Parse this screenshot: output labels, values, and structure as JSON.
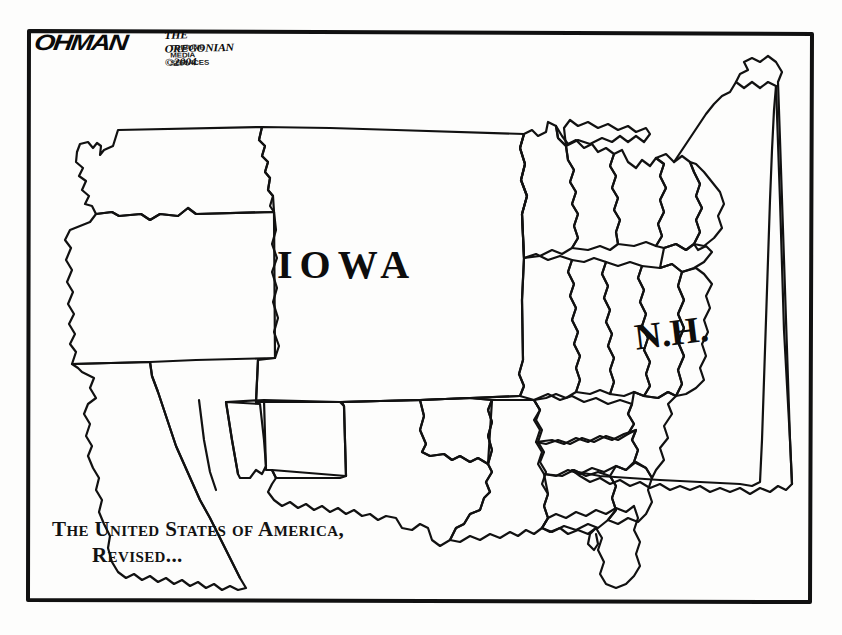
{
  "meta": {
    "medium": "editorial-cartoon",
    "ink_color": "#111111",
    "paper_color": "#fdfdfc",
    "frame_color": "#111111"
  },
  "signature": {
    "artist": "OHMAN",
    "publication": "THE OREGONIAN ©2004",
    "syndicate": "TRIBUNE MEDIA SERVICES"
  },
  "map": {
    "labels": [
      {
        "name": "iowa",
        "text": "IOWA"
      },
      {
        "name": "new-hampshire",
        "text": "N.H."
      }
    ]
  },
  "caption": {
    "line1": "The United States of America,",
    "line2": "Revised..."
  }
}
